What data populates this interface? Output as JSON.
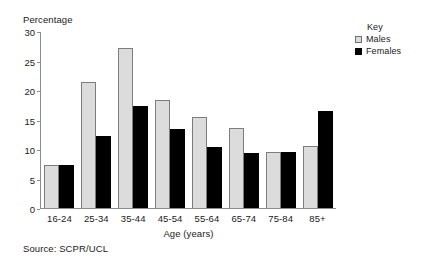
{
  "chart_data": {
    "type": "bar",
    "title": "",
    "xlabel": "Age (years)",
    "ylabel": "Percentage",
    "ylim": [
      0,
      30
    ],
    "yticks": [
      0,
      5,
      10,
      15,
      20,
      25,
      30
    ],
    "grid": false,
    "legend_position": "top-right",
    "legend_title": "Key",
    "categories": [
      "16-24",
      "25-34",
      "35-44",
      "45-54",
      "55-64",
      "65-74",
      "75-84",
      "85+"
    ],
    "series": [
      {
        "name": "Males",
        "color": "#dcdcdc",
        "values": [
          7.3,
          21.4,
          27.3,
          18.4,
          15.5,
          13.6,
          9.5,
          10.5
        ]
      },
      {
        "name": "Females",
        "color": "#000000",
        "values": [
          7.3,
          12.3,
          17.4,
          13.5,
          10.4,
          9.4,
          9.5,
          16.6
        ]
      }
    ],
    "source": "Source: SCPR/UCL"
  }
}
